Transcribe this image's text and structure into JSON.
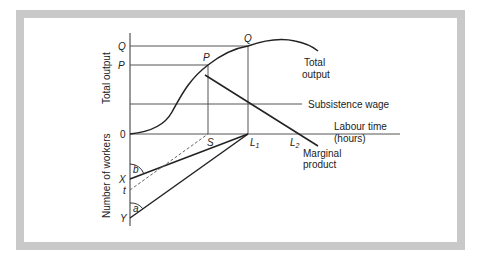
{
  "diagram": {
    "axes": {
      "top_y_label": "Total output",
      "bottom_y_label": "Number of workers",
      "x_label_line1": "Labour time",
      "x_label_line2": "(hours)",
      "origin": "0"
    },
    "y_ticks": {
      "Q": "Q",
      "P": "P",
      "X": "X",
      "t": "t",
      "Y": "Y"
    },
    "x_ticks": {
      "S": "S",
      "L1": "L",
      "L1_sub": "1",
      "L2": "L",
      "L2_sub": "2"
    },
    "point_labels": {
      "P": "P",
      "Q": "Q"
    },
    "curves": {
      "total_output_line1": "Total",
      "total_output_line2": "output",
      "subsistence_wage": "Subsistence wage",
      "marginal_product_line1": "Marginal",
      "marginal_product_line2": "product"
    },
    "angles": {
      "b": "b",
      "a": "a"
    },
    "colors": {
      "frame": "#c9c9c9",
      "line": "#222222",
      "thin": "#555555"
    }
  }
}
